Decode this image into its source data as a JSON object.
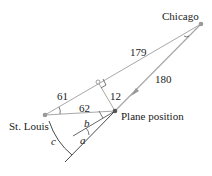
{
  "diagram": {
    "places": {
      "chicago": "Chicago",
      "st_louis": "St. Louis",
      "plane": "Plane position"
    },
    "distances": {
      "chicago_st_louis_upper": "179",
      "chicago_st_louis_lower": "61",
      "chicago_plane": "180",
      "perpendicular": "12",
      "plane_st_louis": "62"
    },
    "angles": {
      "a": "a",
      "b": "b",
      "c": "c"
    },
    "colors": {
      "line": "#a0a0a0",
      "dark_line": "#333333",
      "point": "#999999"
    }
  }
}
